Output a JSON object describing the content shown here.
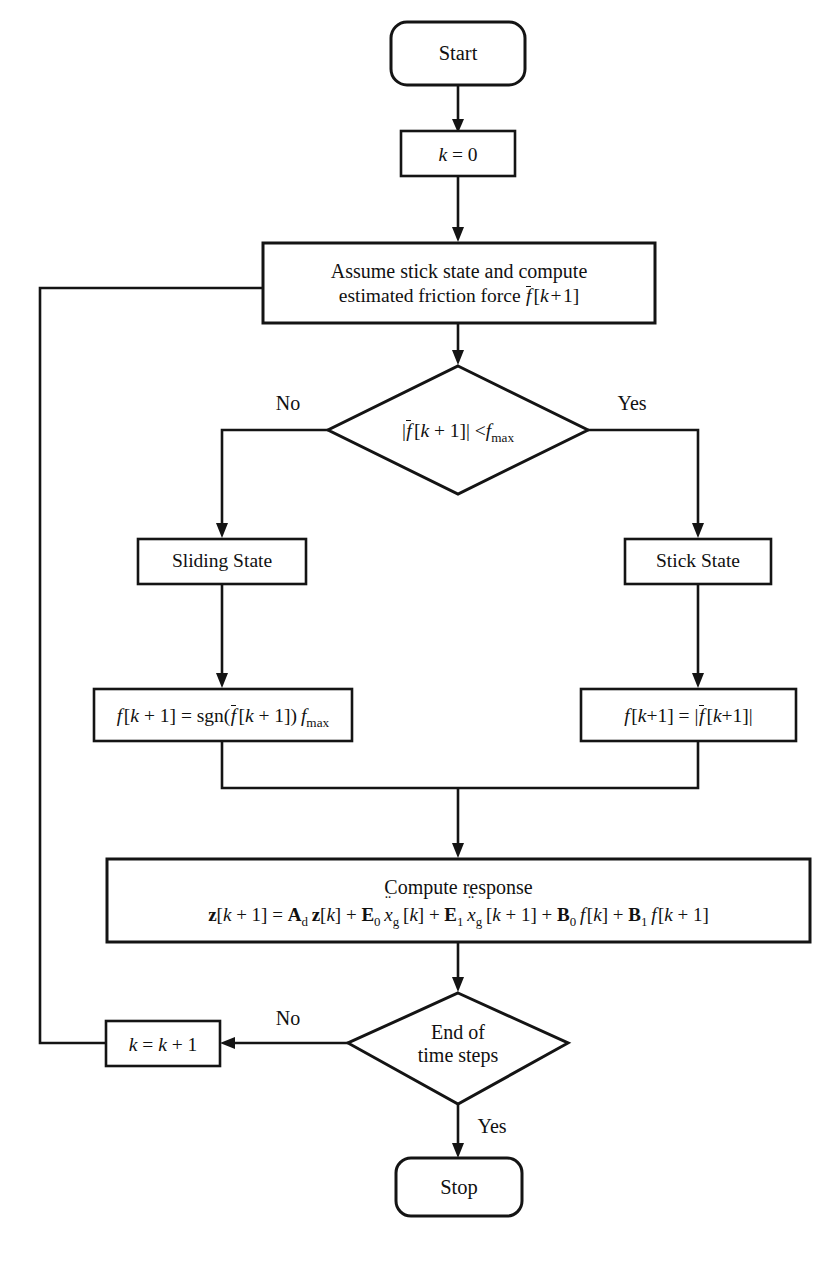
{
  "diagram": {
    "type": "flowchart",
    "background_color": "#ffffff",
    "line_color": "#141414",
    "nodes": [
      {
        "id": "start",
        "shape": "rounded-rect",
        "label": "Start"
      },
      {
        "id": "init",
        "shape": "rect",
        "label": "k = 0"
      },
      {
        "id": "assume",
        "shape": "rect",
        "line1": "Assume stick state and compute",
        "line2_prefix": "estimated friction force ",
        "line2_math": "f̄ [k + 1]"
      },
      {
        "id": "decision1",
        "shape": "diamond",
        "label": "|f̄ [k + 1]| < f_max"
      },
      {
        "id": "sliding",
        "shape": "rect",
        "label": "Sliding State"
      },
      {
        "id": "stick",
        "shape": "rect",
        "label": "Stick State"
      },
      {
        "id": "slide_eq",
        "shape": "rect",
        "label": "f [k + 1] = sgn(f̄ [k + 1]) f_max"
      },
      {
        "id": "stick_eq",
        "shape": "rect",
        "label": "f [k + 1] = |f̄ [k + 1]|"
      },
      {
        "id": "response",
        "shape": "rect",
        "line1": "Compute response",
        "line2": "z[k + 1] = A_d z[k] + E_0 ẍ_g [k] + E_1 ẍ_g [k + 1] + B_0 f [k] + B_1 f [k + 1]"
      },
      {
        "id": "decision2",
        "shape": "diamond",
        "line1": "End of",
        "line2": "time steps"
      },
      {
        "id": "increment",
        "shape": "rect",
        "label": "k = k + 1"
      },
      {
        "id": "stop",
        "shape": "rounded-rect",
        "label": "Stop"
      }
    ],
    "branch_labels": {
      "decision1_no": "No",
      "decision1_yes": "Yes",
      "decision2_no": "No",
      "decision2_yes": "Yes"
    },
    "edges": [
      {
        "from": "start",
        "to": "init",
        "label": ""
      },
      {
        "from": "init",
        "to": "assume",
        "label": ""
      },
      {
        "from": "assume",
        "to": "decision1",
        "label": ""
      },
      {
        "from": "decision1",
        "to": "sliding",
        "label": "No"
      },
      {
        "from": "decision1",
        "to": "stick",
        "label": "Yes"
      },
      {
        "from": "sliding",
        "to": "slide_eq",
        "label": ""
      },
      {
        "from": "stick",
        "to": "stick_eq",
        "label": ""
      },
      {
        "from": "slide_eq",
        "to": "response",
        "label": ""
      },
      {
        "from": "stick_eq",
        "to": "response",
        "label": ""
      },
      {
        "from": "response",
        "to": "decision2",
        "label": ""
      },
      {
        "from": "decision2",
        "to": "increment",
        "label": "No"
      },
      {
        "from": "decision2",
        "to": "stop",
        "label": "Yes"
      },
      {
        "from": "increment",
        "to": "assume",
        "label": ""
      }
    ]
  }
}
